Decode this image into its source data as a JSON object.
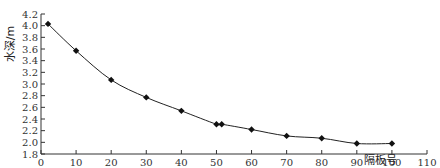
{
  "chart_data": {
    "type": "line",
    "title": "",
    "xlabel": "隔板号",
    "ylabel": "水深/m",
    "xlim": [
      0,
      110
    ],
    "ylim": [
      1.8,
      4.2
    ],
    "x_ticks": [
      0,
      10,
      20,
      30,
      40,
      50,
      60,
      70,
      80,
      90,
      100,
      110
    ],
    "y_ticks": [
      1.8,
      2.0,
      2.2,
      2.4,
      2.6,
      2.8,
      3.0,
      3.2,
      3.4,
      3.6,
      3.8,
      4.0,
      4.2
    ],
    "y_tick_labels": [
      "1.8",
      "2.0",
      "2.2",
      "2.4",
      "2.6",
      "2.8",
      "3.0",
      "3.2",
      "3.4",
      "3.6",
      "3.8",
      "4.0",
      "4.2"
    ],
    "grid": false,
    "legend": null,
    "series": [
      {
        "name": "水深",
        "marker": "diamond",
        "color": "#111111",
        "x": [
          2,
          10,
          20,
          30,
          40,
          50,
          51.5,
          60,
          70,
          80,
          90,
          100
        ],
        "y": [
          4.03,
          3.57,
          3.07,
          2.77,
          2.54,
          2.31,
          2.31,
          2.22,
          2.11,
          2.07,
          1.98,
          1.98
        ]
      }
    ]
  }
}
